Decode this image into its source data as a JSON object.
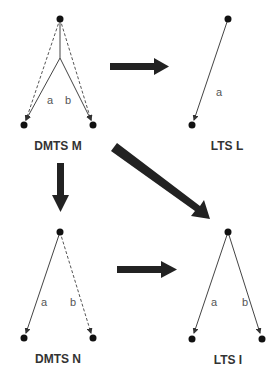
{
  "diagrams": {
    "dmts_m": {
      "title": "DMTS M",
      "edge_a": "a",
      "edge_b": "b"
    },
    "lts_l": {
      "title": "LTS L",
      "edge_a": "a"
    },
    "dmts_n": {
      "title": "DMTS N",
      "edge_a": "a",
      "edge_b": "b"
    },
    "lts_i": {
      "title": "LTS I",
      "edge_a": "a",
      "edge_b": "b"
    }
  },
  "arrows": [
    {
      "from": "DMTS M",
      "to": "LTS L"
    },
    {
      "from": "DMTS M",
      "to": "DMTS N"
    },
    {
      "from": "DMTS M",
      "to": "LTS I"
    },
    {
      "from": "DMTS N",
      "to": "LTS I"
    }
  ],
  "colors": {
    "node": "#111111",
    "arrow": "#222222",
    "edge": "#444444"
  }
}
